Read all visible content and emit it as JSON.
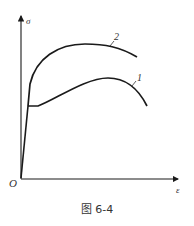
{
  "figure": {
    "caption": "图 6-4",
    "axes": {
      "y_label": "σ",
      "x_label": "ε",
      "origin_label": "O"
    },
    "curves": [
      {
        "id": "1",
        "label": "1",
        "description": "stress-strain curve with yield plateau"
      },
      {
        "id": "2",
        "label": "2",
        "description": "stress-strain curve without distinct yield point"
      }
    ],
    "colors": {
      "line": "#1a1a1a",
      "text": "#333333"
    }
  }
}
